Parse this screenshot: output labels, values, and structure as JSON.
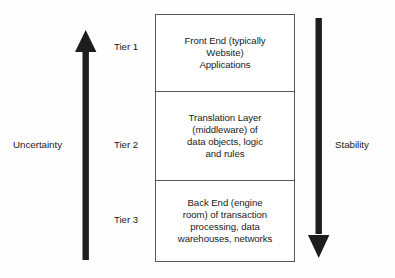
{
  "diagram": {
    "background_color": "#fefefe",
    "line_color": "#58585a",
    "arrow_color": "#1d1d1d",
    "text_color": "#1a1a1a",
    "axes": {
      "left": {
        "caption": "Uncertainty",
        "arrow_direction": "up",
        "icon": "arrow-up-icon"
      },
      "right": {
        "caption": "Stability",
        "arrow_direction": "down",
        "icon": "arrow-down-icon"
      }
    },
    "tiers": [
      {
        "label": "Tier 1",
        "lines": [
          "Front End (typically",
          "Website)",
          "Applications"
        ]
      },
      {
        "label": "Tier 2",
        "lines": [
          "Translation Layer",
          "(middleware) of",
          "data objects, logic",
          "and rules"
        ]
      },
      {
        "label": "Tier 3",
        "lines": [
          "Back End (engine",
          "room) of transaction",
          "processing, data",
          "warehouses, networks"
        ]
      }
    ]
  }
}
